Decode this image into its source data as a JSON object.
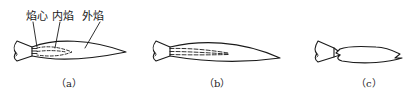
{
  "diagram": {
    "type": "flame-types",
    "panels": [
      {
        "id": "a",
        "caption": "（a）",
        "labels": {
          "core": "焰心",
          "inner": "内焰",
          "outer": "外焰"
        }
      },
      {
        "id": "b",
        "caption": "（b）"
      },
      {
        "id": "c",
        "caption": "（c）"
      }
    ],
    "colors": {
      "line": "#1a1a1a",
      "background": "#ffffff"
    }
  }
}
